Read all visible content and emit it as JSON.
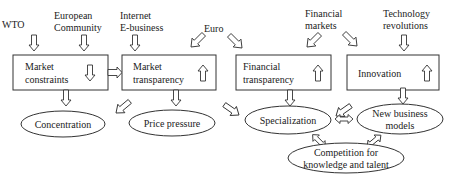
{
  "diagram": {
    "drivers": [
      {
        "id": "wto",
        "lines": [
          "WTO"
        ]
      },
      {
        "id": "european-community",
        "lines": [
          "European",
          "Community"
        ]
      },
      {
        "id": "internet",
        "lines": [
          "Internet",
          "E-business"
        ]
      },
      {
        "id": "euro",
        "lines": [
          "Euro"
        ]
      },
      {
        "id": "financial-markets",
        "lines": [
          "Financial",
          "markets"
        ]
      },
      {
        "id": "technology",
        "lines": [
          "Technology",
          "revolutions"
        ]
      }
    ],
    "boxes": [
      {
        "id": "market-constraints",
        "lines": [
          "Market",
          "constraints"
        ],
        "trend": "down"
      },
      {
        "id": "market-transparency",
        "lines": [
          "Market",
          "transparency"
        ],
        "trend": "up"
      },
      {
        "id": "financial-transparency",
        "lines": [
          "Financial",
          "transparency"
        ],
        "trend": "up"
      },
      {
        "id": "innovation",
        "lines": [
          "Innovation"
        ],
        "trend": "up"
      }
    ],
    "outcomes": [
      {
        "id": "concentration",
        "lines": [
          "Concentration"
        ]
      },
      {
        "id": "price-pressure",
        "lines": [
          "Price pressure"
        ]
      },
      {
        "id": "specialization",
        "lines": [
          "Specialization"
        ]
      },
      {
        "id": "new-business-models",
        "lines": [
          "New business",
          "models"
        ]
      },
      {
        "id": "competition",
        "lines": [
          "Competition for",
          "knowledge and talent"
        ]
      }
    ],
    "colors": {
      "stroke": "#333333",
      "text": "#222222",
      "background": "#ffffff"
    }
  }
}
